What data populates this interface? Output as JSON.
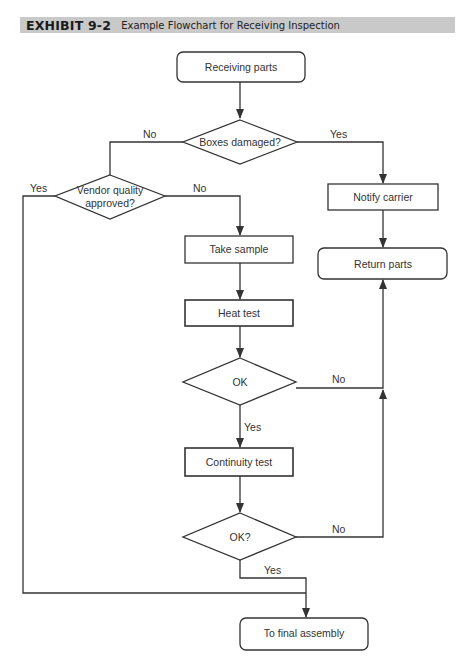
{
  "header": {
    "exhibit": "EXHIBIT 9-2",
    "title": "Example Flowchart for Receiving Inspection"
  },
  "nodes": {
    "receiving_parts": "Receiving parts",
    "boxes_damaged": "Boxes damaged?",
    "vendor_quality_line1": "Vendor quality",
    "vendor_quality_line2": "approved?",
    "notify_carrier": "Notify carrier",
    "take_sample": "Take sample",
    "return_parts": "Return parts",
    "heat_test": "Heat test",
    "ok1": "OK",
    "continuity_test": "Continuity test",
    "ok2": "OK?",
    "final_assembly": "To final assembly"
  },
  "edges": {
    "boxes_no": "No",
    "boxes_yes": "Yes",
    "vendor_yes": "Yes",
    "vendor_no": "No",
    "ok1_no": "No",
    "ok1_yes": "Yes",
    "ok2_no": "No",
    "ok2_yes": "Yes"
  },
  "colors": {
    "header_bg": "#c9c9c9",
    "stroke": "#333333"
  }
}
